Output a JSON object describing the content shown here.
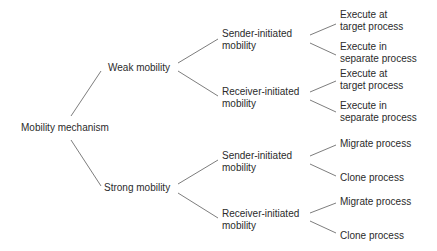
{
  "diagram": {
    "type": "tree",
    "root": {
      "label": "Mobility mechanism"
    },
    "weak": {
      "label": "Weak mobility",
      "sender": {
        "line1": "Sender-initiated",
        "line2": "mobility",
        "leaf1": {
          "line1": "Execute at",
          "line2": "target process"
        },
        "leaf2": {
          "line1": "Execute in",
          "line2": "separate process"
        }
      },
      "receiver": {
        "line1": "Receiver-initiated",
        "line2": "mobility",
        "leaf1": {
          "line1": "Execute at",
          "line2": "target process"
        },
        "leaf2": {
          "line1": "Execute in",
          "line2": "separate process"
        }
      }
    },
    "strong": {
      "label": "Strong mobility",
      "sender": {
        "line1": "Sender-initiated",
        "line2": "mobility",
        "leaf1": {
          "label": "Migrate process"
        },
        "leaf2": {
          "label": "Clone process"
        }
      },
      "receiver": {
        "line1": "Receiver-initiated",
        "line2": "mobility",
        "leaf1": {
          "label": "Migrate process"
        },
        "leaf2": {
          "label": "Clone process"
        }
      }
    },
    "colors": {
      "text": "#2b2b2b",
      "edge": "#6e6e6e",
      "background": "#ffffff"
    }
  }
}
